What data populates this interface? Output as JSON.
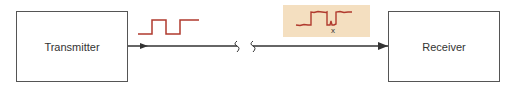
{
  "diagram": {
    "transmitter": {
      "label": "Transmitter"
    },
    "receiver": {
      "label": "Receiver"
    },
    "received_signal": {
      "error_marker": "x"
    },
    "colors": {
      "signal": "#b03a2e",
      "line": "#333333",
      "noise_background": "#f4dfc0",
      "box_border": "#555555"
    }
  }
}
